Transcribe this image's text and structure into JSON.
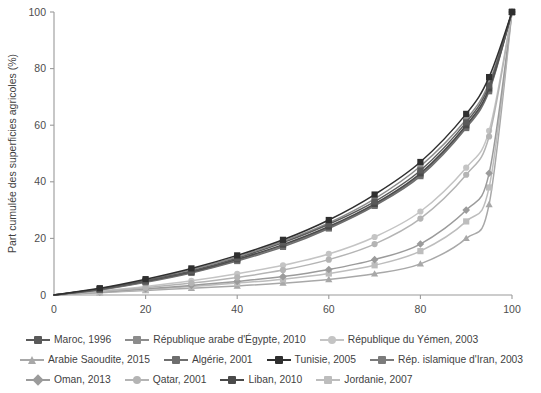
{
  "chart_data": {
    "type": "line",
    "title": "",
    "xlabel": "Part cumulée des propriétés foncières (%)",
    "ylabel": "Part cumulée des superficies agricoles (%)",
    "xlim": [
      0,
      100
    ],
    "ylim": [
      0,
      100
    ],
    "xticks": [
      0,
      20,
      40,
      60,
      80,
      100
    ],
    "yticks": [
      0,
      20,
      40,
      60,
      80,
      100
    ],
    "grid": false,
    "legend_position": "bottom",
    "series": [
      {
        "name": "Maroc, 1996",
        "marker": "square",
        "color": "#5a5a5a",
        "x": [
          0,
          10,
          20,
          30,
          40,
          50,
          60,
          70,
          80,
          90,
          95,
          100
        ],
        "y": [
          0,
          2.0,
          5.0,
          8.5,
          13.0,
          18.5,
          25.0,
          33.0,
          44.0,
          61.0,
          74.0,
          100.0
        ]
      },
      {
        "name": "Arabie Saoudite, 2015",
        "marker": "triangle",
        "color": "#a8a8a8",
        "x": [
          0,
          10,
          20,
          30,
          40,
          50,
          60,
          70,
          80,
          90,
          95,
          100
        ],
        "y": [
          0,
          0.8,
          1.6,
          2.4,
          3.2,
          4.2,
          5.5,
          7.5,
          11.0,
          20.0,
          32.0,
          100.0
        ]
      },
      {
        "name": "Oman, 2013",
        "marker": "diamond",
        "color": "#9b9b9b",
        "x": [
          0,
          10,
          20,
          30,
          40,
          50,
          60,
          70,
          80,
          90,
          95,
          100
        ],
        "y": [
          0,
          1.0,
          2.2,
          3.4,
          4.8,
          6.5,
          9.0,
          12.5,
          18.0,
          30.0,
          43.0,
          100.0
        ]
      },
      {
        "name": "République arabe d'Égypte, 2010",
        "marker": "square",
        "color": "#8c8c8c",
        "x": [
          0,
          10,
          20,
          30,
          40,
          50,
          60,
          70,
          80,
          90,
          95,
          100
        ],
        "y": [
          0,
          2.2,
          5.2,
          9.0,
          13.5,
          19.0,
          25.5,
          34.0,
          45.5,
          62.0,
          75.0,
          100.0
        ]
      },
      {
        "name": "Algérie, 2001",
        "marker": "square",
        "color": "#6e6e6e",
        "x": [
          0,
          10,
          20,
          30,
          40,
          50,
          60,
          70,
          80,
          90,
          95,
          100
        ],
        "y": [
          0,
          1.8,
          4.5,
          7.8,
          12.0,
          17.0,
          23.5,
          31.5,
          42.0,
          59.0,
          72.0,
          100.0
        ]
      },
      {
        "name": "Tunisie, 2005",
        "marker": "square",
        "color": "#2f2f2f",
        "x": [
          0,
          10,
          20,
          30,
          40,
          50,
          60,
          70,
          80,
          90,
          95,
          100
        ],
        "y": [
          0,
          2.4,
          5.6,
          9.4,
          14.0,
          19.5,
          26.5,
          35.5,
          47.0,
          64.0,
          77.0,
          100.0
        ]
      },
      {
        "name": "Qatar, 2001",
        "marker": "circle",
        "color": "#b4b4b4",
        "x": [
          0,
          10,
          20,
          30,
          40,
          50,
          60,
          70,
          80,
          90,
          95,
          100
        ],
        "y": [
          0,
          1.2,
          2.6,
          4.2,
          6.2,
          8.8,
          12.5,
          18.0,
          27.0,
          42.5,
          56.0,
          100.0
        ]
      },
      {
        "name": "Liban, 2010",
        "marker": "square",
        "color": "#4a4a4a",
        "x": [
          0,
          10,
          20,
          30,
          40,
          50,
          60,
          70,
          80,
          90,
          95,
          100
        ],
        "y": [
          0,
          2.1,
          4.9,
          8.2,
          12.6,
          17.8,
          24.2,
          32.2,
          43.0,
          60.0,
          73.0,
          100.0
        ]
      },
      {
        "name": "République du Yémen, 2003",
        "marker": "circle",
        "color": "#c4c4c4",
        "x": [
          0,
          10,
          20,
          30,
          40,
          50,
          60,
          70,
          80,
          90,
          95,
          100
        ],
        "y": [
          0,
          1.4,
          3.0,
          5.0,
          7.5,
          10.5,
          14.5,
          20.5,
          29.5,
          45.0,
          58.0,
          100.0
        ]
      },
      {
        "name": "Rép. islamique d'Iran, 2003",
        "marker": "square",
        "color": "#7b7b7b",
        "x": [
          0,
          10,
          20,
          30,
          40,
          50,
          60,
          70,
          80,
          90,
          95,
          100
        ],
        "y": [
          0,
          1.9,
          4.7,
          8.0,
          12.3,
          17.4,
          23.8,
          31.8,
          42.5,
          59.5,
          72.5,
          100.0
        ]
      },
      {
        "name": "Jordanie, 2007",
        "marker": "square",
        "color": "#bdbdbd",
        "x": [
          0,
          10,
          20,
          30,
          40,
          50,
          60,
          70,
          80,
          90,
          95,
          100
        ],
        "y": [
          0,
          0.9,
          1.9,
          3.0,
          4.2,
          5.6,
          7.6,
          10.5,
          15.5,
          26.0,
          38.0,
          100.0
        ]
      }
    ]
  },
  "legend": {
    "rows": [
      [
        {
          "name": "Maroc, 1996",
          "idx": 0
        },
        {
          "name": "République arabe d'Égypte, 2010",
          "idx": 3
        },
        {
          "name": "République du Yémen, 2003",
          "idx": 8
        }
      ],
      [
        {
          "name": "Arabie Saoudite, 2015",
          "idx": 1
        },
        {
          "name": "Algérie, 2001",
          "idx": 4
        },
        {
          "name": "Tunisie, 2005",
          "idx": 5
        },
        {
          "name": "Rép. islamique d'Iran, 2003",
          "idx": 9
        }
      ],
      [
        {
          "name": "Oman, 2013",
          "idx": 2
        },
        {
          "name": "Qatar, 2001",
          "idx": 6
        },
        {
          "name": "Liban, 2010",
          "idx": 7
        },
        {
          "name": "Jordanie, 2007",
          "idx": 10
        }
      ]
    ]
  }
}
